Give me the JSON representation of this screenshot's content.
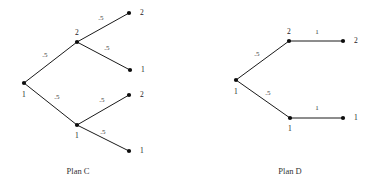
{
  "figure": {
    "title": "",
    "background_color": "#ffffff",
    "line_color": "#1a1a1a",
    "node_color": "#0d0d0d",
    "text_color": "#2b2b2b"
  },
  "chart_data": {
    "type": "diagram",
    "diagram_kind": "decision-tree",
    "title": "",
    "panels": [
      {
        "caption": "Plan C",
        "nodes": [
          {
            "id": "c-root",
            "label": "1",
            "x": 24,
            "y": 83,
            "label_dx": 0,
            "label_dy": 12,
            "label_anchor": "middle"
          },
          {
            "id": "c-up",
            "label": "2",
            "x": 77,
            "y": 42,
            "label_dx": 0,
            "label_dy": -9,
            "label_anchor": "middle"
          },
          {
            "id": "c-lo",
            "label": "1",
            "x": 77,
            "y": 125,
            "label_dx": 0,
            "label_dy": 11,
            "label_anchor": "middle"
          },
          {
            "id": "c-l1",
            "label": "2",
            "x": 129,
            "y": 13,
            "label_dx": 11,
            "label_dy": 0,
            "label_anchor": "start"
          },
          {
            "id": "c-l2",
            "label": "1",
            "x": 130,
            "y": 70,
            "label_dx": 11,
            "label_dy": 0,
            "label_anchor": "start"
          },
          {
            "id": "c-l3",
            "label": "2",
            "x": 129,
            "y": 95,
            "label_dx": 11,
            "label_dy": 0,
            "label_anchor": "start"
          },
          {
            "id": "c-l4",
            "label": "1",
            "x": 129,
            "y": 151,
            "label_dx": 11,
            "label_dy": 0,
            "label_anchor": "start"
          }
        ],
        "edges": [
          {
            "from": "c-root",
            "to": "c-up",
            "label": ".5",
            "lx": 45,
            "ly": 55
          },
          {
            "from": "c-root",
            "to": "c-lo",
            "label": ".5",
            "lx": 57,
            "ly": 97
          },
          {
            "from": "c-up",
            "to": "c-l1",
            "label": ".5",
            "lx": 101,
            "ly": 18
          },
          {
            "from": "c-up",
            "to": "c-l2",
            "label": ".5",
            "lx": 107,
            "ly": 48
          },
          {
            "from": "c-lo",
            "to": "c-l3",
            "label": ".5",
            "lx": 102,
            "ly": 100
          },
          {
            "from": "c-lo",
            "to": "c-l4",
            "label": ".5",
            "lx": 103,
            "ly": 132
          }
        ]
      },
      {
        "caption": "Plan D",
        "nodes": [
          {
            "id": "d-root",
            "label": "1",
            "x": 236,
            "y": 80,
            "label_dx": 0,
            "label_dy": 12,
            "label_anchor": "middle"
          },
          {
            "id": "d-up",
            "label": "2",
            "x": 289,
            "y": 41,
            "label_dx": 0,
            "label_dy": -9,
            "label_anchor": "middle"
          },
          {
            "id": "d-lo",
            "label": "1",
            "x": 290,
            "y": 118,
            "label_dx": 0,
            "label_dy": 11,
            "label_anchor": "middle"
          },
          {
            "id": "d-l1",
            "label": "2",
            "x": 343,
            "y": 41,
            "label_dx": 11,
            "label_dy": 0,
            "label_anchor": "start"
          },
          {
            "id": "d-l2",
            "label": "1",
            "x": 343,
            "y": 118,
            "label_dx": 11,
            "label_dy": 0,
            "label_anchor": "start"
          }
        ],
        "edges": [
          {
            "from": "d-root",
            "to": "d-up",
            "label": ".5",
            "lx": 257,
            "ly": 54
          },
          {
            "from": "d-root",
            "to": "d-lo",
            "label": ".5",
            "lx": 268,
            "ly": 93
          },
          {
            "from": "d-up",
            "to": "d-l1",
            "label": "1",
            "lx": 317,
            "ly": 32
          },
          {
            "from": "d-lo",
            "to": "d-l2",
            "label": "1",
            "lx": 317,
            "ly": 108
          }
        ]
      }
    ],
    "captions": [
      {
        "text": "Plan C",
        "x": 78,
        "y": 171
      },
      {
        "text": "Plan D",
        "x": 290,
        "y": 171
      }
    ]
  }
}
